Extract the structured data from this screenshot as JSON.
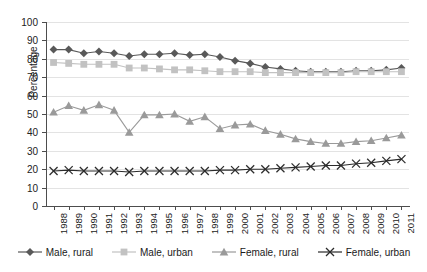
{
  "chart_data": {
    "type": "line",
    "title": "",
    "xlabel": "",
    "ylabel": "Percentage",
    "ylim": [
      0,
      100
    ],
    "ytick_step": 10,
    "grid": true,
    "legend_position": "bottom",
    "categories": [
      "1988",
      "1989",
      "1990",
      "1991",
      "1992",
      "1993",
      "1994",
      "1995",
      "1996",
      "1997",
      "1998",
      "1999",
      "2000",
      "2001",
      "2002",
      "2003",
      "2004",
      "2005",
      "2006",
      "2007",
      "2008",
      "2009",
      "2010",
      "2011"
    ],
    "yticks": [
      "0",
      "10",
      "20",
      "30",
      "40",
      "50",
      "60",
      "70",
      "80",
      "90",
      "100"
    ],
    "series": [
      {
        "name": "Male, rural",
        "marker": "diamond",
        "color": "#595959",
        "values": [
          85,
          85,
          83,
          84,
          83,
          81.5,
          82.5,
          82.5,
          83,
          82,
          82.5,
          81,
          79,
          77.5,
          75.5,
          74.5,
          73.5,
          73,
          73,
          73,
          73.5,
          73.5,
          74,
          75
        ]
      },
      {
        "name": "Male, urban",
        "marker": "square",
        "color": "#c2c2c2",
        "values": [
          78,
          77.5,
          77,
          77,
          77,
          75,
          75,
          74.5,
          74,
          74,
          73.5,
          73,
          73,
          73,
          72.5,
          72.5,
          72.5,
          72.5,
          72.5,
          72.5,
          73,
          73,
          73,
          73
        ]
      },
      {
        "name": "Female, rural",
        "marker": "triangle",
        "color": "#9a9a9a",
        "values": [
          51,
          54.5,
          52,
          55,
          52,
          40,
          49.5,
          49.5,
          50,
          46,
          48.5,
          42,
          44,
          44.5,
          41,
          39,
          36.5,
          35,
          34,
          34,
          35,
          35.5,
          37,
          38.5
        ]
      },
      {
        "name": "Female, urban",
        "marker": "cross",
        "color": "#2b2b2b",
        "values": [
          19,
          19.5,
          19,
          19,
          19,
          18.5,
          19,
          19,
          19,
          19,
          19,
          19.5,
          19.5,
          20,
          20,
          20.5,
          21,
          21.5,
          22,
          22,
          23,
          23.5,
          24.5,
          25.5
        ]
      }
    ]
  },
  "legend": {
    "items": [
      {
        "label": "Male, rural"
      },
      {
        "label": "Male, urban"
      },
      {
        "label": "Female, rural"
      },
      {
        "label": "Female, urban"
      }
    ]
  }
}
